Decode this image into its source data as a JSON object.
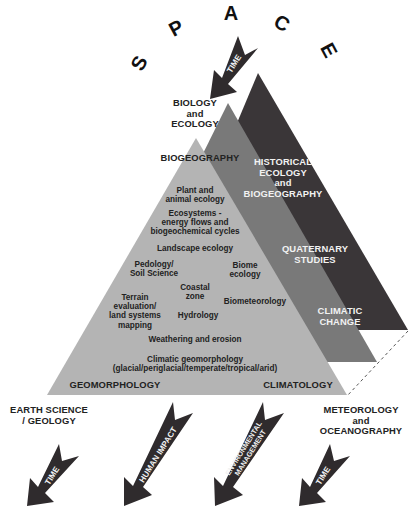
{
  "title_letters": [
    "S",
    "P",
    "A",
    "C",
    "E"
  ],
  "colors": {
    "front_triangle": "#b4b4b4",
    "middle_triangle": "#797979",
    "back_triangle": "#3a3638",
    "arrow": "#2f2b2d",
    "text_dark": "#222222",
    "text_light": "#f2f2f2"
  },
  "top_arrow": {
    "label": "TIME"
  },
  "disciplines": {
    "top": [
      "BIOLOGY",
      "and",
      "ECOLOGY"
    ],
    "bottom_left": [
      "EARTH SCIENCE",
      "/ GEOLOGY"
    ],
    "bottom_right": [
      "METEOROLOGY",
      "and",
      "OCEANOGRAPHY"
    ]
  },
  "front_triangle": {
    "title": "BIOGEOGRAPHY",
    "corner_left": "GEOMORPHOLOGY",
    "corner_right": "CLIMATOLOGY",
    "topics": {
      "plant_animal": [
        "Plant and",
        "animal ecology"
      ],
      "ecosystems": [
        "Ecosystems -",
        "energy flows and",
        "biogeochemical cycles"
      ],
      "landscape": "Landscape ecology",
      "pedology": [
        "Pedology/",
        "Soil Science"
      ],
      "biome": [
        "Biome",
        "ecology"
      ],
      "coastal": [
        "Coastal",
        "zone"
      ],
      "terrain": [
        "Terrain",
        "evaluation/",
        "land systems",
        "mapping"
      ],
      "biometeorology": "Biometeorology",
      "hydrology": "Hydrology",
      "weathering": "Weathering and erosion",
      "climatic_geomorphology": [
        "Climatic geomorphology",
        "(glacial/periglacial/temperate/tropical/arid)"
      ]
    }
  },
  "middle_triangle": {
    "labels": {
      "historical": [
        "HISTORICAL",
        "ECOLOGY",
        "and",
        "BIOGEOGRAPHY"
      ],
      "climatic_change": [
        "CLIMATIC",
        "CHANGE"
      ]
    }
  },
  "back_triangle": {
    "labels": {
      "quaternary": [
        "QUATERNARY",
        "STUDIES"
      ]
    }
  },
  "bottom_arrows": [
    {
      "label": [
        "TIME"
      ]
    },
    {
      "label": [
        "HUMAN IMPACT"
      ]
    },
    {
      "label": [
        "ENVIRONMENTAL",
        "MANAGEMENT"
      ]
    },
    {
      "label": [
        "TIME"
      ]
    }
  ]
}
